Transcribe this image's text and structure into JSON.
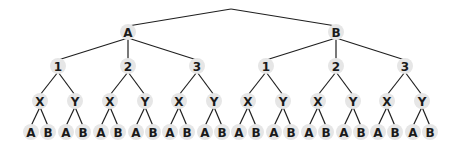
{
  "diagram": {
    "type": "tree",
    "root": {
      "label": "",
      "x": 231,
      "y": 9
    },
    "colors": {
      "node_fill": "#e6e6e6",
      "edge": "#1f1f1f",
      "text": "#1a1a1a",
      "background": "#ffffff"
    },
    "levels": {
      "first": [
        "A",
        "B"
      ],
      "second": [
        "1",
        "2",
        "3"
      ],
      "third": [
        "X",
        "Y"
      ],
      "leaves": [
        "A",
        "B"
      ]
    },
    "layout": {
      "first_x": [
        128,
        336
      ],
      "first_y": 32,
      "second_offsets": [
        -70,
        0,
        69
      ],
      "second_y": 66,
      "third_offsets": [
        -18,
        17
      ],
      "third_y": 101,
      "leaf_offsets": [
        -9,
        8
      ],
      "leaf_y": 132,
      "node_radius": 8
    }
  }
}
